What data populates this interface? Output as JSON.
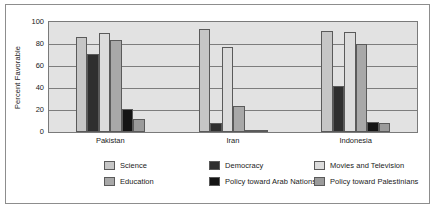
{
  "chart_data": {
    "type": "bar",
    "title": "",
    "xlabel": "",
    "ylabel": "Percent Favorable",
    "ylim": [
      0,
      100
    ],
    "yticks": [
      0,
      20,
      40,
      60,
      80,
      100
    ],
    "grid": true,
    "legend_position": "bottom",
    "categories": [
      "Pakistan",
      "Iran",
      "Indonesia"
    ],
    "series": [
      {
        "name": "Science",
        "color": "#c6c6c6",
        "values": [
          86,
          94,
          92
        ]
      },
      {
        "name": "Democracy",
        "color": "#2f2f2f",
        "values": [
          71,
          8,
          42
        ]
      },
      {
        "name": "Movies and Television",
        "color": "#dcdcdc",
        "values": [
          90,
          77,
          91
        ]
      },
      {
        "name": "Education",
        "color": "#a8a8a8",
        "values": [
          84,
          24,
          80
        ]
      },
      {
        "name": "Policy toward Arab Nations",
        "color": "#141414",
        "values": [
          21,
          0,
          9
        ]
      },
      {
        "name": "Policy toward Palestinians",
        "color": "#9b9b9b",
        "values": [
          12,
          2,
          8
        ]
      }
    ]
  },
  "legend": {
    "items": [
      {
        "label": "Science",
        "color": "#c6c6c6"
      },
      {
        "label": "Education",
        "color": "#a8a8a8"
      },
      {
        "label": "Democracy",
        "color": "#2f2f2f"
      },
      {
        "label": "Policy toward Arab Nations",
        "color": "#141414"
      },
      {
        "label": "Movies and Television",
        "color": "#dcdcdc"
      },
      {
        "label": "Policy toward Palestinians",
        "color": "#9b9b9b"
      }
    ]
  }
}
